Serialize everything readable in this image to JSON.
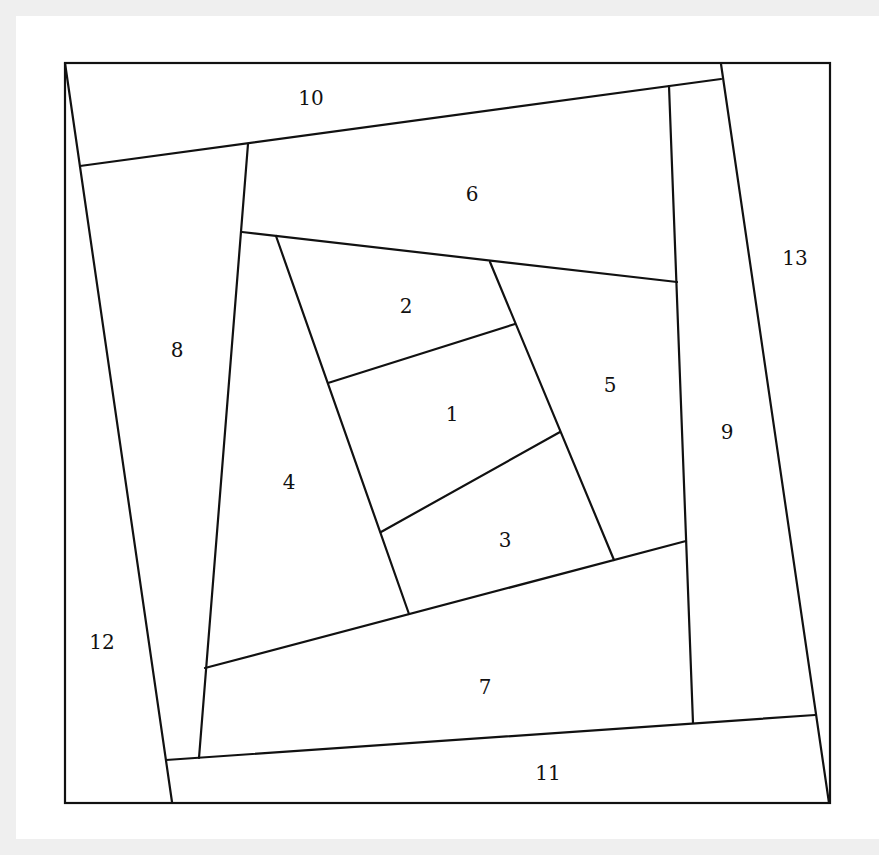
{
  "diagram": {
    "title": "",
    "type": "quilt-block-piecing-diagram",
    "colors": {
      "background": "#efefef",
      "panel": "#ffffff",
      "stroke": "#111111",
      "text": "#111111"
    },
    "outer_box": {
      "x1": 65,
      "y1": 63,
      "x2": 830,
      "y2": 803
    },
    "pieces": [
      {
        "id": "1",
        "label": "1",
        "x": 452,
        "y": 414
      },
      {
        "id": "2",
        "label": "2",
        "x": 406,
        "y": 306
      },
      {
        "id": "3",
        "label": "3",
        "x": 505,
        "y": 540
      },
      {
        "id": "4",
        "label": "4",
        "x": 289,
        "y": 482
      },
      {
        "id": "5",
        "label": "5",
        "x": 610,
        "y": 385
      },
      {
        "id": "6",
        "label": "6",
        "x": 472,
        "y": 194
      },
      {
        "id": "7",
        "label": "7",
        "x": 485,
        "y": 687
      },
      {
        "id": "8",
        "label": "8",
        "x": 177,
        "y": 350
      },
      {
        "id": "9",
        "label": "9",
        "x": 727,
        "y": 432
      },
      {
        "id": "10",
        "label": "10",
        "x": 311,
        "y": 98
      },
      {
        "id": "11",
        "label": "11",
        "x": 548,
        "y": 773
      },
      {
        "id": "12",
        "label": "12",
        "x": 102,
        "y": 642
      },
      {
        "id": "13",
        "label": "13",
        "x": 795,
        "y": 258
      }
    ],
    "seams": [
      {
        "name": "seam-10-bottom",
        "x1": 80,
        "y1": 166,
        "x2": 721,
        "y2": 79
      },
      {
        "name": "seam-13-left",
        "x1": 721,
        "y1": 64,
        "x2": 829,
        "y2": 803
      },
      {
        "name": "seam-12-right",
        "x1": 65,
        "y1": 63,
        "x2": 172,
        "y2": 802
      },
      {
        "name": "seam-11-top",
        "x1": 166,
        "y1": 760,
        "x2": 815,
        "y2": 715
      },
      {
        "name": "seam-8-right",
        "x1": 248,
        "y1": 144,
        "x2": 199,
        "y2": 758
      },
      {
        "name": "seam-9-left",
        "x1": 669,
        "y1": 86,
        "x2": 693,
        "y2": 723
      },
      {
        "name": "seam-6-bottom",
        "x1": 242,
        "y1": 232,
        "x2": 677,
        "y2": 282
      },
      {
        "name": "seam-4-right",
        "x1": 276,
        "y1": 236,
        "x2": 409,
        "y2": 614
      },
      {
        "name": "seam-5-left",
        "x1": 490,
        "y1": 262,
        "x2": 614,
        "y2": 560
      },
      {
        "name": "seam-7-top",
        "x1": 205,
        "y1": 668,
        "x2": 686,
        "y2": 541
      },
      {
        "name": "seam-2-1",
        "x1": 328,
        "y1": 383,
        "x2": 515,
        "y2": 324
      },
      {
        "name": "seam-1-3",
        "x1": 381,
        "y1": 532,
        "x2": 560,
        "y2": 432
      }
    ]
  }
}
